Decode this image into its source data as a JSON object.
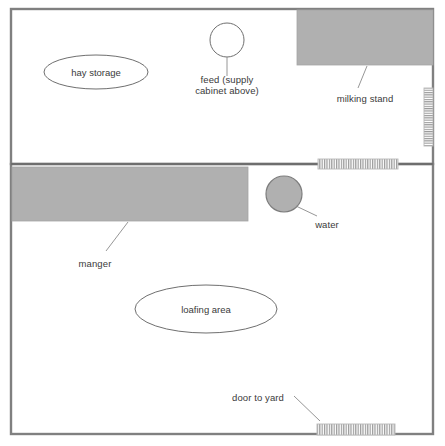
{
  "diagram": {
    "type": "floor-plan",
    "colors": {
      "wall": "#808080",
      "fill": "#b0b0b0",
      "text": "#3a3a3a",
      "background": "#ffffff",
      "leader": "#808080"
    }
  },
  "rooms": [
    {
      "id": "upper-room",
      "name": "milking / feed room",
      "x": 11,
      "y": 9,
      "w": 422,
      "h": 155
    },
    {
      "id": "lower-room",
      "name": "loafing room",
      "x": 11,
      "y": 164,
      "w": 422,
      "h": 270
    }
  ],
  "fixtures": [
    {
      "id": "hay-storage",
      "shape": "ellipse",
      "label": "hay storage",
      "cx": 96,
      "cy": 72,
      "rx": 52,
      "ry": 17,
      "filled": false
    },
    {
      "id": "feed",
      "shape": "circle",
      "label": "feed (supply\ncabinet above)",
      "cx": 227,
      "cy": 40,
      "r": 17,
      "filled": false
    },
    {
      "id": "milking-stand",
      "shape": "rect",
      "label": "milking stand",
      "x": 297,
      "y": 10,
      "w": 136,
      "h": 55,
      "filled": true
    },
    {
      "id": "manger",
      "shape": "rect",
      "label": "manger",
      "x": 12,
      "y": 167,
      "w": 236,
      "h": 54,
      "filled": true
    },
    {
      "id": "water",
      "shape": "circle",
      "label": "water",
      "cx": 284,
      "cy": 194,
      "r": 18,
      "filled": true
    },
    {
      "id": "loafing-area",
      "shape": "ellipse",
      "label": "loafing area",
      "cx": 206,
      "cy": 309,
      "rx": 71,
      "ry": 24,
      "filled": false
    }
  ],
  "doors": [
    {
      "id": "door-right-wall",
      "label": "",
      "orientation": "vertical",
      "x": 424,
      "y": 88,
      "w": 9,
      "h": 58,
      "stripes": 26
    },
    {
      "id": "door-between-rooms",
      "label": "",
      "orientation": "horizontal",
      "x": 318,
      "y": 159,
      "w": 80,
      "h": 10,
      "stripes": 34
    },
    {
      "id": "door-to-yard",
      "label": "door to yard",
      "orientation": "horizontal",
      "x": 317,
      "y": 424,
      "w": 78,
      "h": 11,
      "stripes": 33
    }
  ],
  "labels": [
    {
      "id": "hay-storage-label",
      "text": "hay storage",
      "x": 96,
      "y": 72,
      "align": "zone"
    },
    {
      "id": "feed-label",
      "text": "feed (supply\ncabinet above)",
      "x": 227,
      "y": 80,
      "align": "center"
    },
    {
      "id": "milking-stand-label",
      "text": "milking stand",
      "x": 365,
      "y": 93,
      "align": "center"
    },
    {
      "id": "manger-label",
      "text": "manger",
      "x": 95,
      "y": 258,
      "align": "center"
    },
    {
      "id": "water-label",
      "text": "water",
      "x": 327,
      "y": 219,
      "align": "center"
    },
    {
      "id": "loafing-area-label",
      "text": "loafing area",
      "x": 206,
      "y": 309,
      "align": "zone"
    },
    {
      "id": "door-to-yard-label",
      "text": "door to yard",
      "x": 258,
      "y": 394,
      "align": "center"
    }
  ],
  "leaders": [
    {
      "id": "feed-leader",
      "x1": 227,
      "y1": 57,
      "x2": 227,
      "y2": 76
    },
    {
      "id": "milking-stand-leader",
      "x1": 367,
      "y1": 66,
      "x2": 358,
      "y2": 88
    },
    {
      "id": "manger-leader",
      "x1": 128,
      "y1": 222,
      "x2": 106,
      "y2": 251
    },
    {
      "id": "water-leader",
      "x1": 296,
      "y1": 206,
      "x2": 317,
      "y2": 216
    },
    {
      "id": "door-to-yard-leader",
      "x1": 294,
      "y1": 396,
      "x2": 320,
      "y2": 421
    }
  ]
}
